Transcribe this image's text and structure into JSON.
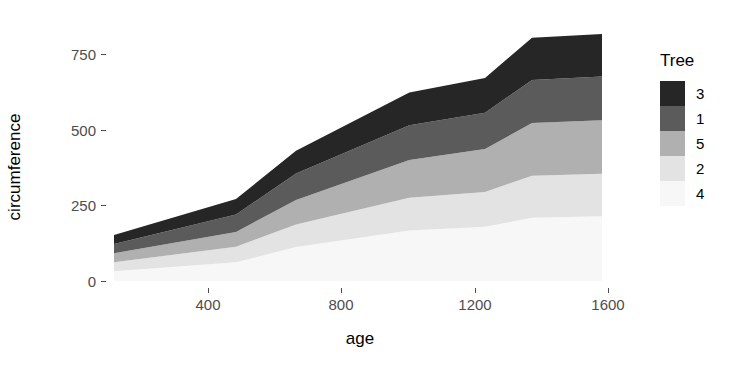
{
  "chart_data": {
    "type": "area",
    "stacked": true,
    "title": "",
    "subtitle": "",
    "xlabel": "age",
    "ylabel": "circumference",
    "xlim": [
      118,
      1582
    ],
    "ylim": [
      0,
      893
    ],
    "grid": false,
    "background": "#ffffff",
    "x": [
      118,
      484,
      664,
      1004,
      1231,
      1372,
      1582
    ],
    "xticks": [
      400,
      800,
      1200,
      1600
    ],
    "xticklabels": [
      "400",
      "800",
      "1200",
      "1600"
    ],
    "yticks": [
      0,
      250,
      500,
      750
    ],
    "yticklabels": [
      "0",
      "250",
      "500",
      "750"
    ],
    "stack_order_bottom_to_top": [
      "4",
      "2",
      "5",
      "1",
      "3"
    ],
    "series": [
      {
        "name": "4",
        "legend_label": "4",
        "color": "#f7f7f7",
        "values": [
          32,
          62,
          112,
          167,
          179,
          209,
          214
        ]
      },
      {
        "name": "2",
        "legend_label": "2",
        "color": "#e3e3e3",
        "values": [
          30,
          51,
          75,
          108,
          115,
          139,
          140
        ]
      },
      {
        "name": "5",
        "legend_label": "5",
        "color": "#b0b0b0",
        "values": [
          30,
          49,
          81,
          125,
          142,
          174,
          177
        ]
      },
      {
        "name": "1",
        "legend_label": "1",
        "color": "#5b5b5b",
        "values": [
          30,
          58,
          87,
          115,
          120,
          142,
          145
        ]
      },
      {
        "name": "3",
        "legend_label": "3",
        "color": "#262626",
        "values": [
          30,
          51,
          75,
          108,
          115,
          140,
          140
        ]
      }
    ]
  },
  "axes": {
    "x": {
      "title": "age",
      "ticks": [
        {
          "value": 400,
          "label": "400"
        },
        {
          "value": 800,
          "label": "800"
        },
        {
          "value": 1200,
          "label": "1200"
        },
        {
          "value": 1600,
          "label": "1600"
        }
      ]
    },
    "y": {
      "title": "circumference",
      "ticks": [
        {
          "value": 750,
          "label": "750"
        },
        {
          "value": 500,
          "label": "500"
        },
        {
          "value": 250,
          "label": "250"
        },
        {
          "value": 0,
          "label": "0"
        }
      ]
    }
  },
  "legend": {
    "title": "Tree",
    "position": "right",
    "items": [
      {
        "label": "3",
        "color": "#262626"
      },
      {
        "label": "1",
        "color": "#5b5b5b"
      },
      {
        "label": "5",
        "color": "#b0b0b0"
      },
      {
        "label": "2",
        "color": "#e3e3e3"
      },
      {
        "label": "4",
        "color": "#f7f7f7"
      }
    ]
  },
  "colors": {
    "axis_text": "#4d4d4d",
    "title_text": "#000000",
    "panel_background": "#ffffff"
  }
}
